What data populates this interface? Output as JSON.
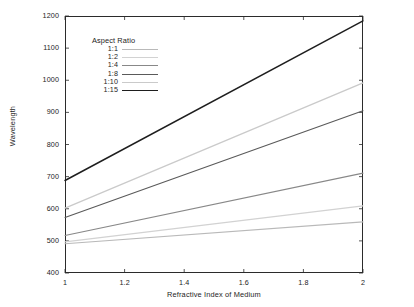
{
  "axes": {
    "x_title": "Refractive Index of Medium",
    "y_title": "Wavelength",
    "x_ticks": [
      "1",
      "1.2",
      "1.4",
      "1.6",
      "1.8",
      "2"
    ],
    "y_ticks": [
      "400",
      "500",
      "600",
      "700",
      "800",
      "900",
      "1000",
      "1100",
      "1200"
    ]
  },
  "legend": {
    "title": "Aspect Ratio",
    "entries": [
      {
        "label": "1:1",
        "color": "#b9b9b9"
      },
      {
        "label": "1:2",
        "color": "#d2d2d2"
      },
      {
        "label": "1:4",
        "color": "#888888"
      },
      {
        "label": "1:8",
        "color": "#5a5a5a"
      },
      {
        "label": "1:10",
        "color": "#cacaca"
      },
      {
        "label": "1:15",
        "color": "#1e1e1e"
      }
    ]
  },
  "chart_data": {
    "type": "line",
    "title": "",
    "xlabel": "Refractive Index of Medium",
    "ylabel": "Wavelength",
    "xlim": [
      1,
      2
    ],
    "ylim": [
      400,
      1200
    ],
    "xticks": [
      1,
      1.2,
      1.4,
      1.6,
      1.8,
      2
    ],
    "yticks": [
      400,
      500,
      600,
      700,
      800,
      900,
      1000,
      1100,
      1200
    ],
    "grid": false,
    "legend_position": "upper-left-inside",
    "legend_title": "Aspect Ratio",
    "x": [
      1,
      2
    ],
    "series": [
      {
        "name": "1:1",
        "values": [
          491,
          559
        ],
        "color": "#b9b9b9",
        "width": 1.1
      },
      {
        "name": "1:2",
        "values": [
          497,
          609
        ],
        "color": "#d2d2d2",
        "width": 1.1
      },
      {
        "name": "1:4",
        "values": [
          517,
          711
        ],
        "color": "#888888",
        "width": 1.1
      },
      {
        "name": "1:8",
        "values": [
          573,
          905
        ],
        "color": "#5a5a5a",
        "width": 1.1
      },
      {
        "name": "1:10",
        "values": [
          602,
          992
        ],
        "color": "#cacaca",
        "width": 1.3
      },
      {
        "name": "1:15",
        "values": [
          688,
          1185
        ],
        "color": "#1e1e1e",
        "width": 1.5
      }
    ]
  }
}
